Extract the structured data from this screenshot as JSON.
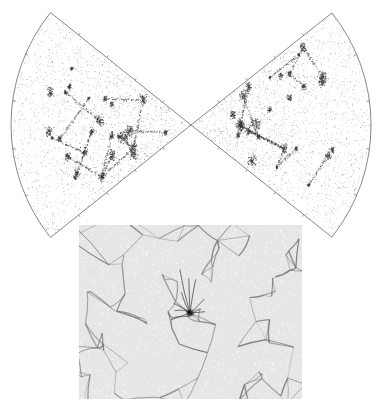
{
  "figure": {
    "colors": {
      "background": "#ffffff",
      "outline": "#7a7a7a",
      "points": "#555555",
      "dense_points": "#333333",
      "sim_background": "#e6e6e6",
      "filaments": "#6e6e6e"
    },
    "wedges": [
      {
        "id": "left-survey-wedge",
        "apex": [
          191,
          125
        ],
        "radius": 180,
        "direction_deg": 180,
        "half_angle_deg": 38.7,
        "tick_count": 5
      },
      {
        "id": "right-survey-wedge",
        "apex": [
          191,
          125
        ],
        "radius": 180,
        "direction_deg": 0,
        "half_angle_deg": 38.5,
        "tick_count": 5
      }
    ],
    "simulation_panel": {
      "id": "cosmic-web-simulation-map",
      "x": 79,
      "y": 225,
      "width": 223,
      "height": 174,
      "densest_node": [
        190,
        313
      ]
    }
  }
}
